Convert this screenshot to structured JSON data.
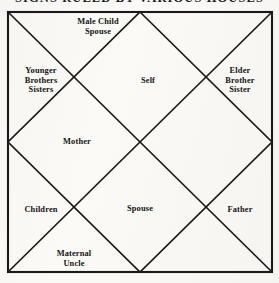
{
  "header": {
    "title": "SIGNS RULED BY VARIOUS HOUSES"
  },
  "chart": {
    "type": "north-indian-kundali",
    "shape": "square with inscribed diamond and two diagonals",
    "house_count": 12,
    "ink_color": "#1a1a1a",
    "paper_color": "#fbfaf6",
    "border_width_px": 2,
    "inner_line_width_px": 1.6,
    "houses": [
      {
        "id": "house-1",
        "position": "top-center-diamond",
        "label": "Self",
        "x": 148,
        "y": 81
      },
      {
        "id": "house-2",
        "position": "top-left-triangle",
        "label": "Male Child\nSpouse",
        "x": 98,
        "y": 27
      },
      {
        "id": "house-3",
        "position": "left-upper-triangle",
        "label": "Younger\nBrothers\nSisters",
        "x": 41,
        "y": 80
      },
      {
        "id": "house-4",
        "position": "left-center-diamond",
        "label": "Mother",
        "x": 77,
        "y": 142
      },
      {
        "id": "house-5",
        "position": "left-lower-triangle",
        "label": "Children",
        "x": 41,
        "y": 210
      },
      {
        "id": "house-6",
        "position": "bottom-left-triangle",
        "label": "Maternal\nUncle",
        "x": 74,
        "y": 259
      },
      {
        "id": "house-7",
        "position": "bottom-center-diamond",
        "label": "Spouse",
        "x": 140,
        "y": 209
      },
      {
        "id": "house-8",
        "position": "bottom-right-triangle",
        "label": "",
        "x": 205,
        "y": 259
      },
      {
        "id": "house-9",
        "position": "right-lower-triangle",
        "label": "Father",
        "x": 240,
        "y": 210
      },
      {
        "id": "house-10",
        "position": "right-center-diamond",
        "label": "",
        "x": 206,
        "y": 142
      },
      {
        "id": "house-11",
        "position": "right-upper-triangle",
        "label": "Elder\nBrother\nSister",
        "x": 240,
        "y": 80
      },
      {
        "id": "house-12",
        "position": "top-right-triangle",
        "label": "",
        "x": 205,
        "y": 27
      }
    ]
  }
}
